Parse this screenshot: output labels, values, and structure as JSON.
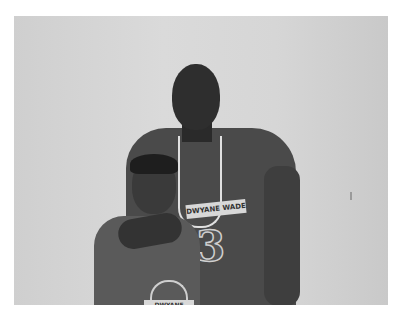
{
  "image": {
    "description": "Grayscale photo of an adult man and a boy smiling in front of a light wall, both wearing Dwyane Wade t-shirts",
    "adult_shirt_text": "DWYANE WADE",
    "adult_shirt_number": "3",
    "kid_shirt_text": "DWYANE WADE"
  }
}
